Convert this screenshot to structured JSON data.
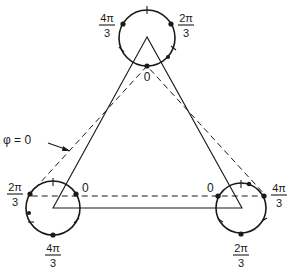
{
  "diagram": {
    "annotation": "φ = 0",
    "top_circle": {
      "left_label": {
        "num": "4π",
        "den": "3"
      },
      "right_label": {
        "num": "2π",
        "den": "3"
      },
      "bottom_label": "0"
    },
    "left_circle": {
      "left_label": {
        "num": "2π",
        "den": "3"
      },
      "right_label": "0",
      "bottom_label": {
        "num": "4π",
        "den": "3"
      }
    },
    "right_circle": {
      "left_label": "0",
      "right_label": {
        "num": "4π",
        "den": "3"
      },
      "bottom_label": {
        "num": "2π",
        "den": "3"
      }
    }
  }
}
